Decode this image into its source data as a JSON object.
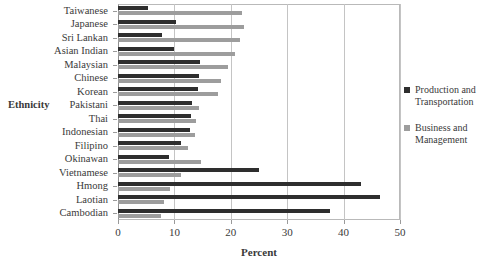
{
  "chart_data": {
    "type": "bar",
    "orientation": "horizontal",
    "title": "",
    "xlabel": "Percent",
    "ylabel": "Ethnicity",
    "xlim": [
      0,
      50
    ],
    "xticks": [
      0,
      10,
      20,
      30,
      40,
      50
    ],
    "grid": true,
    "legend_position": "right",
    "categories": [
      "Taiwanese",
      "Japanese",
      "Sri Lankan",
      "Asian Indian",
      "Malaysian",
      "Chinese",
      "Korean",
      "Pakistani",
      "Thai",
      "Indonesian",
      "Filipino",
      "Okinawan",
      "Vietnamese",
      "Hmong",
      "Laotian",
      "Cambodian"
    ],
    "series": [
      {
        "name": "Production and Transportation",
        "color": "#2e2e2e",
        "values": [
          5.3,
          10.2,
          7.8,
          10.0,
          14.6,
          14.3,
          14.2,
          13.1,
          13.0,
          12.8,
          11.2,
          9.1,
          25.0,
          43.0,
          46.4,
          37.6
        ]
      },
      {
        "name": "Business and Management",
        "color": "#9d9d9d",
        "values": [
          22.0,
          22.4,
          21.6,
          20.8,
          19.5,
          18.3,
          17.8,
          14.4,
          13.9,
          13.7,
          12.4,
          14.8,
          11.1,
          9.3,
          8.2,
          7.6
        ]
      }
    ]
  },
  "legend": {
    "items": [
      {
        "label": "Production and Transportation",
        "color": "#2e2e2e"
      },
      {
        "label": "Business and Management",
        "color": "#9d9d9d"
      }
    ]
  }
}
